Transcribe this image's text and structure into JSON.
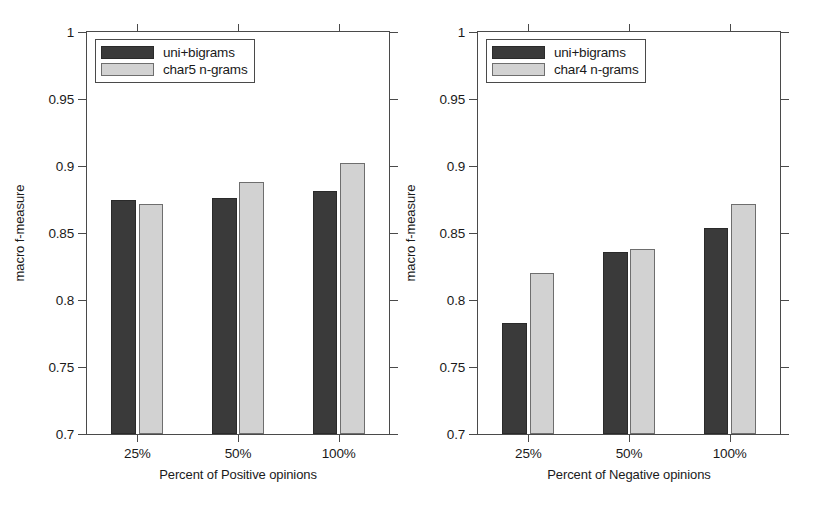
{
  "chart_data": [
    {
      "type": "bar",
      "panel": "left",
      "title": "",
      "xlabel": "Percent of Positive opinions",
      "ylabel": "macro f-measure",
      "categories": [
        "25%",
        "50%",
        "100%"
      ],
      "ylim": [
        0.7,
        1
      ],
      "yticks": [
        "0.7",
        "0.75",
        "0.8",
        "0.85",
        "0.9",
        "0.95",
        "1"
      ],
      "ytick_values": [
        0.7,
        0.75,
        0.8,
        0.85,
        0.9,
        0.95,
        1.0
      ],
      "grid": false,
      "legend_position": "top-left",
      "series": [
        {
          "name": "uni+bigrams",
          "color": "#3a3a3a",
          "values": [
            0.875,
            0.876,
            0.881
          ]
        },
        {
          "name": "char5 n-grams",
          "color": "#d2d2d2",
          "values": [
            0.872,
            0.888,
            0.902
          ]
        }
      ]
    },
    {
      "type": "bar",
      "panel": "right",
      "title": "",
      "xlabel": "Percent of Negative opinions",
      "ylabel": "macro f-measure",
      "categories": [
        "25%",
        "50%",
        "100%"
      ],
      "ylim": [
        0.7,
        1
      ],
      "yticks": [
        "0.7",
        "0.75",
        "0.8",
        "0.85",
        "0.9",
        "0.95",
        "1"
      ],
      "ytick_values": [
        0.7,
        0.75,
        0.8,
        0.85,
        0.9,
        0.95,
        1.0
      ],
      "grid": false,
      "legend_position": "top-left",
      "series": [
        {
          "name": "uni+bigrams",
          "color": "#3a3a3a",
          "values": [
            0.783,
            0.836,
            0.854
          ]
        },
        {
          "name": "char4 n-grams",
          "color": "#d2d2d2",
          "values": [
            0.82,
            0.838,
            0.872
          ]
        }
      ]
    }
  ]
}
